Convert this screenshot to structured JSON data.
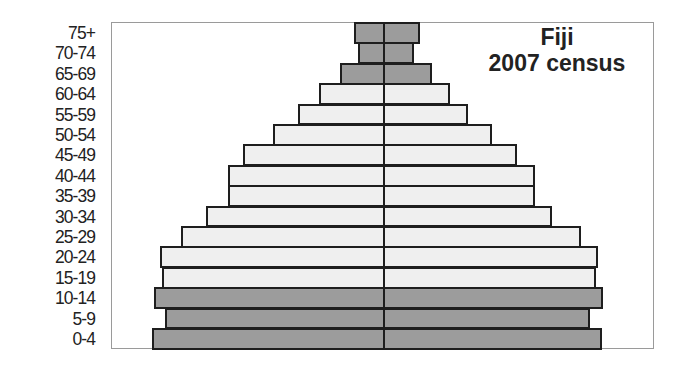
{
  "chart_data": {
    "type": "bar",
    "subtype": "population-pyramid",
    "title": "Fiji",
    "subtitle": "2007 census",
    "categories": [
      "75+",
      "70-74",
      "65-69",
      "60-64",
      "55-59",
      "50-54",
      "45-49",
      "40-44",
      "35-39",
      "30-34",
      "25-29",
      "20-24",
      "15-19",
      "10-14",
      "5-9",
      "0-4"
    ],
    "series": [
      {
        "name": "left",
        "values": [
          30,
          26,
          44,
          65,
          86,
          111,
          141,
          156,
          156,
          178,
          203,
          224,
          222,
          230,
          219,
          232
        ]
      },
      {
        "name": "right",
        "values": [
          36,
          30,
          48,
          66,
          84,
          108,
          133,
          151,
          151,
          168,
          197,
          214,
          212,
          219,
          206,
          218
        ]
      }
    ],
    "shading": [
      "dark",
      "dark",
      "dark",
      "light",
      "light",
      "light",
      "light",
      "light",
      "light",
      "light",
      "light",
      "light",
      "light",
      "dark",
      "dark",
      "dark"
    ],
    "xlabel": "",
    "ylabel": "",
    "grid": false,
    "legend": "none",
    "units": "pixel-relative bar lengths (no axis scale shown)"
  },
  "title": {
    "line1": "Fiji",
    "line2": "2007 census"
  },
  "colors": {
    "dark_bar": "#9c9c9c",
    "light_bar": "#efefef",
    "outline": "#1e1e1e",
    "frame": "#9a9a9a"
  }
}
